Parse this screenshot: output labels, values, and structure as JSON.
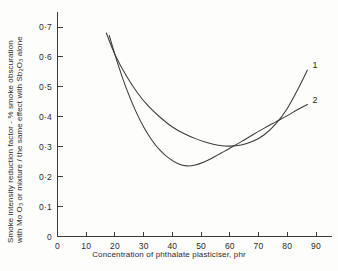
{
  "chart_data": {
    "type": "line",
    "title": "",
    "xlabel": "Concentration of phthalate plasticiser, phr",
    "ylabel_line1": "Smoke intensity reduction factor - % smoke obscuration",
    "ylabel_line2_pre": "with Mo O",
    "ylabel_line2_sub1": "3",
    "ylabel_line2_mid": " or mixture / the same effect with  Sb",
    "ylabel_line2_sub2": "2",
    "ylabel_line2_mid2": "O",
    "ylabel_line2_sub3": "3",
    "ylabel_line2_end": " alone",
    "xlim": [
      0,
      95
    ],
    "ylim": [
      0,
      0.74
    ],
    "grid": false,
    "legend_position": "inline-right-end",
    "xticks": [
      0,
      10,
      20,
      30,
      40,
      50,
      60,
      70,
      80,
      90
    ],
    "xtick_labels": [
      "0",
      "10",
      "20",
      "30",
      "40",
      "50",
      "60",
      "70",
      "80",
      "90"
    ],
    "yticks": [
      0,
      0.1,
      0.2,
      0.3,
      0.4,
      0.5,
      0.6,
      0.7
    ],
    "ytick_labels": [
      "0",
      "0·1",
      "0·2",
      "0·3",
      "0·4",
      "0·5",
      "0·6",
      "0·7"
    ],
    "series": [
      {
        "name": "1",
        "label": "1",
        "x": [
          17,
          20,
          24,
          28,
          32,
          36,
          40,
          44,
          48,
          52,
          56,
          60,
          64,
          68,
          72,
          76,
          80,
          84,
          87
        ],
        "values": [
          0.68,
          0.608,
          0.536,
          0.478,
          0.432,
          0.396,
          0.366,
          0.344,
          0.327,
          0.314,
          0.305,
          0.302,
          0.306,
          0.318,
          0.34,
          0.376,
          0.428,
          0.498,
          0.556
        ]
      },
      {
        "name": "2",
        "label": "2",
        "x": [
          18,
          21,
          24,
          27,
          30,
          33,
          36,
          39,
          42,
          45,
          48,
          51,
          54,
          57,
          60,
          64,
          68,
          72,
          76,
          80,
          84,
          87
        ],
        "values": [
          0.672,
          0.577,
          0.494,
          0.424,
          0.366,
          0.32,
          0.285,
          0.26,
          0.243,
          0.236,
          0.239,
          0.249,
          0.263,
          0.279,
          0.295,
          0.317,
          0.34,
          0.362,
          0.383,
          0.404,
          0.426,
          0.441
        ]
      }
    ]
  },
  "axes": {
    "x_axis_name": "x-axis",
    "y_axis_name": "y-axis"
  },
  "bleedthrough": {
    "text": ""
  }
}
